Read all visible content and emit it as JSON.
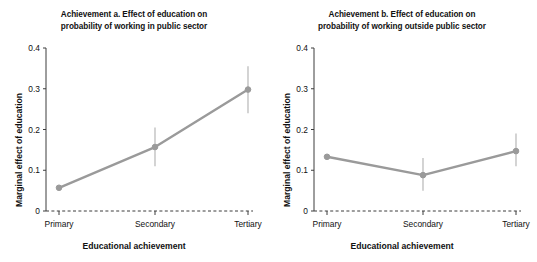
{
  "figure": {
    "width": 537,
    "height": 262,
    "background": "#ffffff"
  },
  "style": {
    "series_color": "#9a9a9a",
    "axis_color": "#3c3c3c",
    "text_color": "#111111",
    "errorbar_color": "#b0b0b0",
    "zero_line_style": "dashed"
  },
  "panels": [
    {
      "key": "panel_a",
      "title_line1": "Achievement a. Effect of education on",
      "title_line2": "probability of working in public sector",
      "ylabel": "Marginal effect of education",
      "xlabel": "Educational achievement"
    },
    {
      "key": "panel_b",
      "title_line1": "Achievement b. Effect of education on",
      "title_line2": "probability of working outside public sector",
      "ylabel": "Marginal effect of education",
      "xlabel": "Educational achievement"
    }
  ],
  "chart_data": [
    {
      "type": "line",
      "title": "Achievement a. Effect of education on probability of working in public sector",
      "xlabel": "Educational achievement",
      "ylabel": "Marginal effect of education",
      "categories": [
        "Primary",
        "Secondary",
        "Tertiary"
      ],
      "values": [
        0.057,
        0.157,
        0.298
      ],
      "error_low": [
        0.057,
        0.11,
        0.24
      ],
      "error_high": [
        0.057,
        0.205,
        0.355
      ],
      "ylim": [
        0,
        0.4
      ],
      "yticks": [
        0,
        0.1,
        0.2,
        0.3,
        0.4
      ],
      "ytick_labels": [
        "0",
        "0.1",
        "0.2",
        "0.3",
        "0.4"
      ],
      "grid": false,
      "legend": "none",
      "zero_reference_line": 0
    },
    {
      "type": "line",
      "title": "Achievement b. Effect of education on probability of working outside public sector",
      "xlabel": "Educational achievement",
      "ylabel": "Marginal effect of education",
      "categories": [
        "Primary",
        "Secondary",
        "Tertiary"
      ],
      "values": [
        0.133,
        0.088,
        0.147
      ],
      "error_low": [
        0.133,
        0.05,
        0.11
      ],
      "error_high": [
        0.133,
        0.13,
        0.19
      ],
      "ylim": [
        0,
        0.4
      ],
      "yticks": [
        0,
        0.1,
        0.2,
        0.3,
        0.4
      ],
      "ytick_labels": [
        "0",
        "0.1",
        "0.2",
        "0.3",
        "0.4"
      ],
      "grid": false,
      "legend": "none",
      "zero_reference_line": 0
    }
  ]
}
